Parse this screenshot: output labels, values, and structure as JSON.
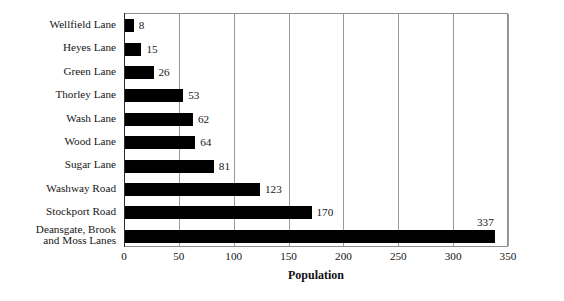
{
  "chart_data": {
    "type": "bar",
    "orientation": "horizontal",
    "title": "",
    "xlabel": "Population",
    "ylabel": "",
    "xlim": [
      0,
      350
    ],
    "xticks": [
      0,
      50,
      100,
      150,
      200,
      250,
      300,
      350
    ],
    "grid": "vertical",
    "legend": "none",
    "bar_color": "#000000",
    "categories": [
      "Wellfield Lane",
      "Heyes Lane",
      "Green Lane",
      "Thorley Lane",
      "Wash Lane",
      "Wood Lane",
      "Sugar Lane",
      "Washway Road",
      "Stockport Road",
      "Deansgate, Brook\nand Moss Lanes"
    ],
    "values": [
      8,
      15,
      26,
      53,
      62,
      64,
      81,
      123,
      170,
      337
    ],
    "value_labels": [
      "8",
      "15",
      "26",
      "53",
      "62",
      "64",
      "81",
      "123",
      "170",
      "337"
    ],
    "label_placement": [
      "right",
      "right",
      "right",
      "right",
      "right",
      "right",
      "right",
      "right",
      "right",
      "above"
    ]
  }
}
